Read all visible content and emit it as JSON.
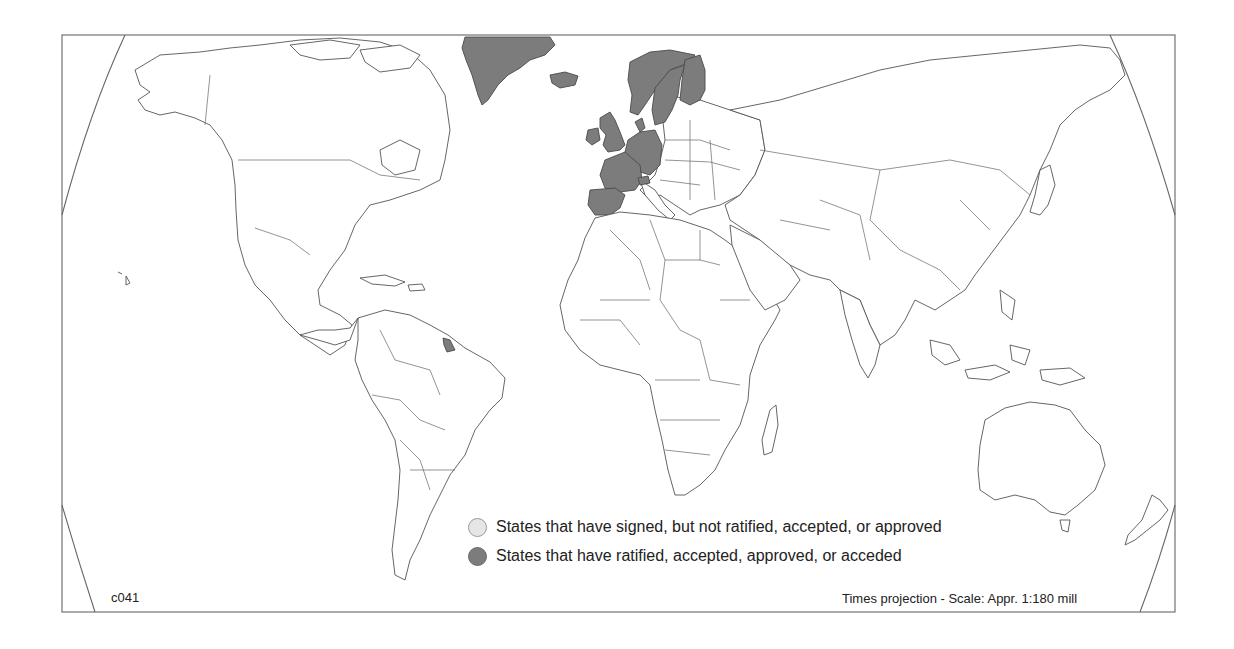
{
  "map": {
    "code": "c041",
    "projection_note": "Times projection - Scale: Appr. 1:180 mill",
    "colors": {
      "signed": "#e6e6e6",
      "ratified": "#7c7c7c",
      "outline": "#555555",
      "background": "#ffffff"
    },
    "ratified_regions": [
      "Greenland",
      "Iceland",
      "Norway",
      "Sweden",
      "Finland",
      "Denmark",
      "Ireland",
      "United Kingdom",
      "Netherlands",
      "Belgium",
      "Luxembourg",
      "Germany",
      "France",
      "Switzerland",
      "Spain",
      "Portugal",
      "French Guiana"
    ]
  },
  "legend": {
    "items": [
      {
        "label": "States that have signed, but not ratified, accepted, or approved",
        "color": "#e6e6e6",
        "icon": "light-gray-circle"
      },
      {
        "label": "States that have ratified, accepted, approved, or acceded",
        "color": "#7c7c7c",
        "icon": "dark-gray-circle"
      }
    ]
  }
}
